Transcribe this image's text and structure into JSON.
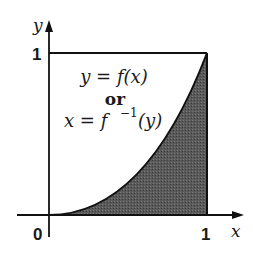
{
  "diagram": {
    "axes": {
      "x_label": "x",
      "y_label": "y",
      "x_tick_labels": [
        "0",
        "1"
      ],
      "y_tick_labels": [
        "1"
      ]
    },
    "equation_lines": {
      "line1": "y = f(x)",
      "line2": "or",
      "line3_lhs": "x = f",
      "line3_sup": "−1",
      "line3_rhs": "(y)"
    },
    "shading": {
      "region": "area under curve from x=0 to x=1",
      "fill_color": "#555555"
    },
    "curve": {
      "description": "increasing convex curve from (0,0) to (1,1)",
      "stroke_color": "#111111"
    },
    "box": {
      "description": "unit square top and right edges"
    }
  }
}
